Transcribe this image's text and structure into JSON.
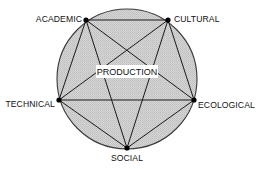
{
  "diagram": {
    "center_label": "PRODUCTION",
    "nodes": [
      {
        "id": "academic",
        "label": "ACADEMIC"
      },
      {
        "id": "cultural",
        "label": "CULTURAL"
      },
      {
        "id": "ecological",
        "label": "ECOLOGICAL"
      },
      {
        "id": "social",
        "label": "SOCIAL"
      },
      {
        "id": "technical",
        "label": "TECHNICAL"
      }
    ],
    "edges": [
      [
        "academic",
        "cultural"
      ],
      [
        "academic",
        "ecological"
      ],
      [
        "academic",
        "social"
      ],
      [
        "academic",
        "technical"
      ],
      [
        "cultural",
        "ecological"
      ],
      [
        "cultural",
        "social"
      ],
      [
        "cultural",
        "technical"
      ],
      [
        "ecological",
        "social"
      ],
      [
        "ecological",
        "technical"
      ],
      [
        "social",
        "technical"
      ]
    ],
    "colors": {
      "circle_fill": "#cfcfcf",
      "line": "#1a1a1a",
      "label_box": "#ffffff"
    }
  }
}
